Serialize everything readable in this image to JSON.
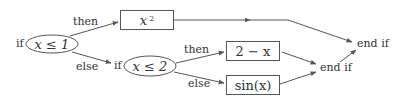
{
  "diagram": {
    "type": "flowchart",
    "outer_if": {
      "keyword": "if",
      "condition": "x ≤ 1",
      "then_label": "then",
      "else_label": "else",
      "then_result": {
        "base": "x",
        "exponent": "2"
      }
    },
    "inner_if": {
      "keyword": "if",
      "condition": "x ≤ 2",
      "then_label": "then",
      "else_label": "else",
      "then_result": "2 − x",
      "else_result": "sin(x)"
    },
    "inner_end": "end if",
    "outer_end": "end if",
    "colors": {
      "stroke": "#555555",
      "text": "#333333",
      "background": "#ffffff"
    }
  }
}
